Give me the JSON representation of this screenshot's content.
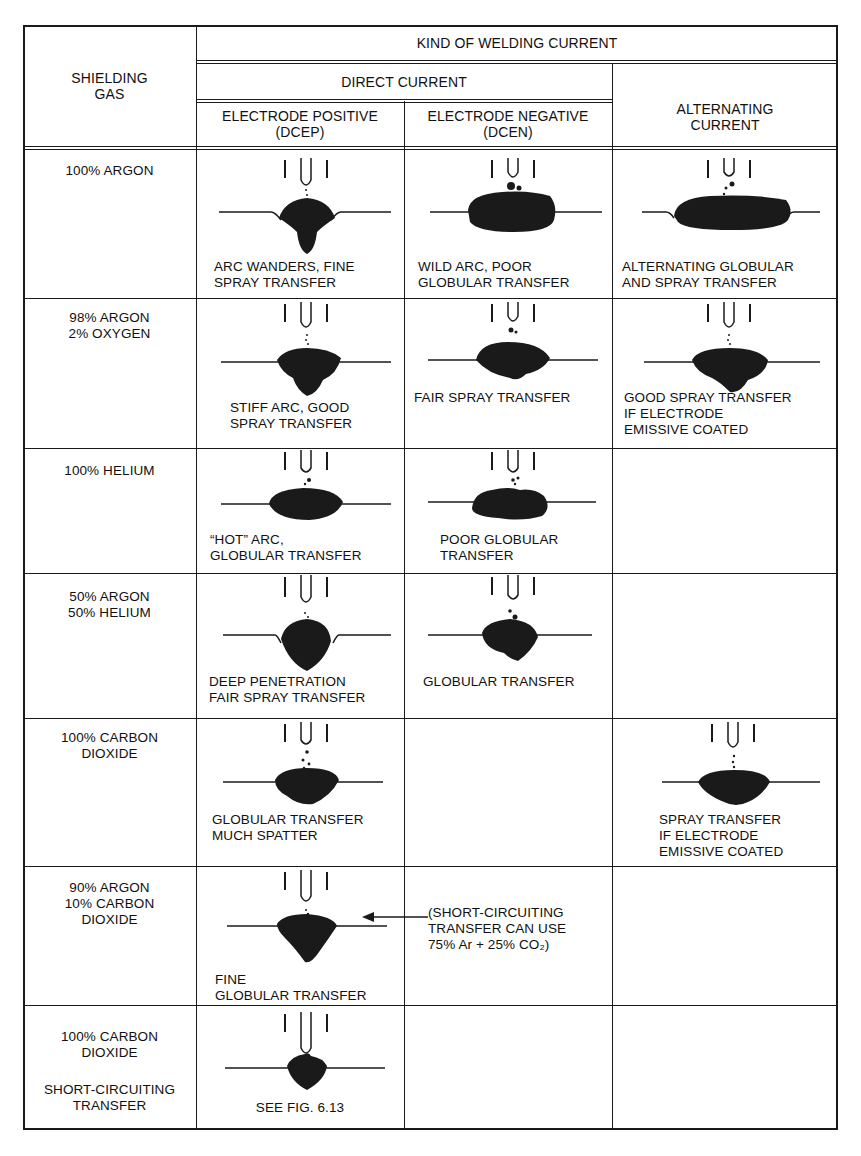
{
  "header": {
    "shielding_gas": "SHIELDING\nGAS",
    "kind_of_current": "KIND OF WELDING CURRENT",
    "direct_current": "DIRECT CURRENT",
    "alternating_current": "ALTERNATING\nCURRENT",
    "dcep": "ELECTRODE POSITIVE\n(DCEP)",
    "dcen": "ELECTRODE NEGATIVE\n(DCEN)"
  },
  "rows": [
    {
      "gas": "100% ARGON",
      "dcep": "ARC WANDERS, FINE\nSPRAY TRANSFER",
      "dcen": "WILD ARC, POOR\nGLOBULAR TRANSFER",
      "ac": "ALTERNATING GLOBULAR\nAND SPRAY TRANSFER"
    },
    {
      "gas": "98% ARGON\n2% OXYGEN",
      "dcep": "STIFF ARC, GOOD\nSPRAY TRANSFER",
      "dcen": "FAIR SPRAY TRANSFER",
      "ac": "GOOD SPRAY TRANSFER\nIF ELECTRODE\nEMISSIVE COATED"
    },
    {
      "gas": "100% HELIUM",
      "dcep": "“HOT” ARC,\nGLOBULAR TRANSFER",
      "dcen": "POOR GLOBULAR\nTRANSFER",
      "ac": ""
    },
    {
      "gas": "50% ARGON\n50% HELIUM",
      "dcep": "DEEP PENETRATION\nFAIR SPRAY TRANSFER",
      "dcen": "GLOBULAR TRANSFER",
      "ac": ""
    },
    {
      "gas": "100% CARBON\nDIOXIDE",
      "dcep": "GLOBULAR TRANSFER\nMUCH SPATTER",
      "dcen": "",
      "ac": "SPRAY TRANSFER\nIF ELECTRODE\nEMISSIVE COATED"
    },
    {
      "gas": "90% ARGON\n10% CARBON\nDIOXIDE",
      "dcep": "FINE\nGLOBULAR TRANSFER",
      "dcen_note": "(SHORT-CIRCUITING\nTRANSFER CAN USE\n75% Ar + 25% CO₂)",
      "ac": ""
    },
    {
      "gas": "100% CARBON\nDIOXIDE",
      "gas_sub": "SHORT-CIRCUITING\nTRANSFER",
      "dcep": "SEE FIG. 6.13",
      "dcen": "",
      "ac": ""
    }
  ],
  "icons": {
    "electrode": "electrode-with-nozzle-icon",
    "weld_bead": "weld-bead-cross-section-icon",
    "arrow": "left-arrow-icon"
  },
  "colors": {
    "ink": "#1a1a1a",
    "paper": "#ffffff"
  }
}
